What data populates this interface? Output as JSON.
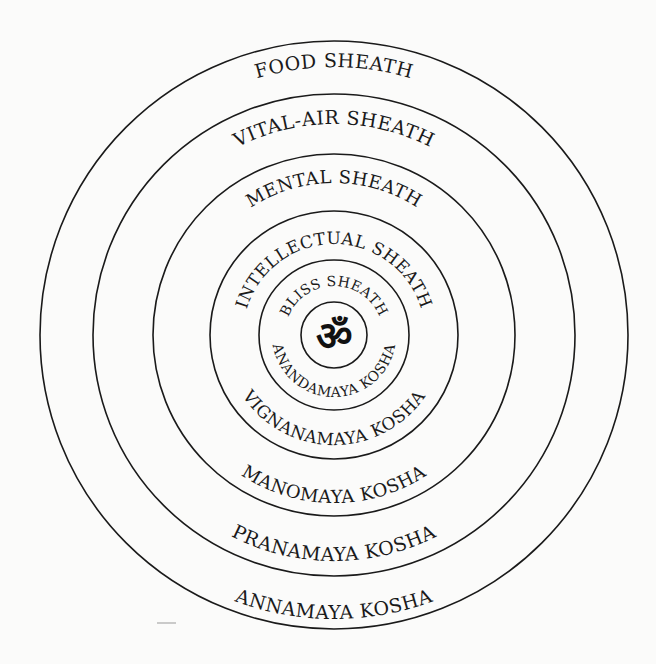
{
  "diagram": {
    "center_symbol": "ॐ",
    "center_symbol_name": "om-symbol",
    "layers": [
      {
        "sheath": "FOOD SHEATH",
        "kosha": "ANNAMAYA KOSHA"
      },
      {
        "sheath": "VITAL-AIR SHEATH",
        "kosha": "PRANAMAYA KOSHA"
      },
      {
        "sheath": "MENTAL SHEATH",
        "kosha": "MANOMAYA KOSHA"
      },
      {
        "sheath": "INTELLECTUAL SHEATH",
        "kosha": "VIGNANAMAYA KOSHA"
      },
      {
        "sheath": "BLISS SHEATH",
        "kosha": "ANANDAMAYA KOSHA"
      }
    ],
    "colors": {
      "line": "#1a1a1a",
      "background": "#fbfbfa"
    }
  }
}
